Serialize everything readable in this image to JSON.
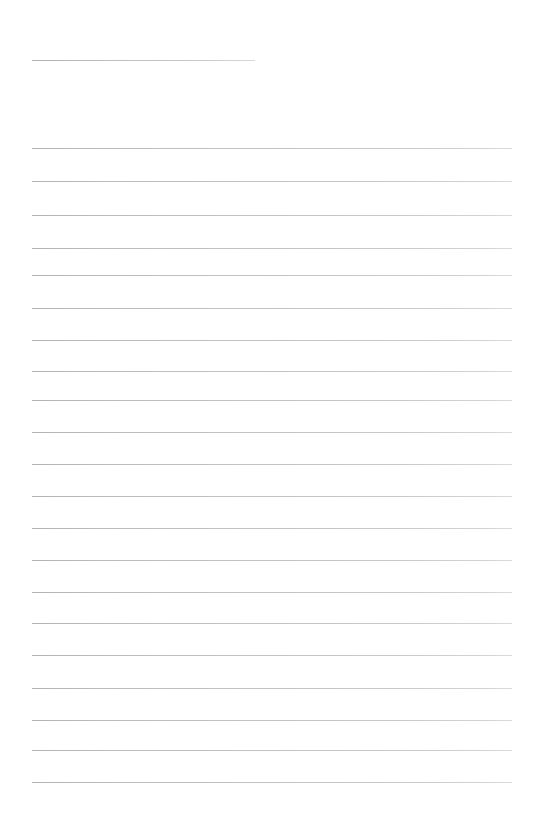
{
  "page": {
    "kind": "ruled-note-page",
    "width_px": 542,
    "height_px": 836,
    "background_color": "#ffffff",
    "content_text": "",
    "note": ""
  },
  "style": {
    "rule_color": "#bcbcc0",
    "rule_color_faded": "#dcdce0",
    "rule_thickness_px": 1,
    "left_margin_px": 32,
    "right_edge_px": 512,
    "line_spacing_px": 33.4
  },
  "header_rule": {
    "label": "header-rule",
    "x": 32,
    "y": 60,
    "width": 223
  },
  "rules": [
    {
      "index": 1,
      "y": 148,
      "x": 32,
      "width": 480
    },
    {
      "index": 2,
      "y": 181,
      "x": 32,
      "width": 480
    },
    {
      "index": 3,
      "y": 215,
      "x": 32,
      "width": 480
    },
    {
      "index": 4,
      "y": 248,
      "x": 32,
      "width": 480
    },
    {
      "index": 5,
      "y": 275,
      "x": 32,
      "width": 480
    },
    {
      "index": 6,
      "y": 308,
      "x": 32,
      "width": 480
    },
    {
      "index": 7,
      "y": 340,
      "x": 32,
      "width": 480
    },
    {
      "index": 8,
      "y": 371,
      "x": 32,
      "width": 480
    },
    {
      "index": 9,
      "y": 400,
      "x": 32,
      "width": 480
    },
    {
      "index": 10,
      "y": 432,
      "x": 32,
      "width": 480
    },
    {
      "index": 11,
      "y": 464,
      "x": 32,
      "width": 480
    },
    {
      "index": 12,
      "y": 496,
      "x": 32,
      "width": 480
    },
    {
      "index": 13,
      "y": 528,
      "x": 32,
      "width": 480
    },
    {
      "index": 14,
      "y": 560,
      "x": 32,
      "width": 480
    },
    {
      "index": 15,
      "y": 592,
      "x": 32,
      "width": 480
    },
    {
      "index": 16,
      "y": 623,
      "x": 32,
      "width": 480
    },
    {
      "index": 17,
      "y": 655,
      "x": 32,
      "width": 480
    },
    {
      "index": 18,
      "y": 688,
      "x": 32,
      "width": 480
    },
    {
      "index": 19,
      "y": 720,
      "x": 32,
      "width": 480
    },
    {
      "index": 20,
      "y": 750,
      "x": 32,
      "width": 480
    },
    {
      "index": 21,
      "y": 782,
      "x": 32,
      "width": 480
    }
  ]
}
